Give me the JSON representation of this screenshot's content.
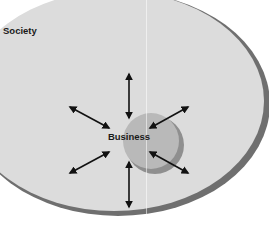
{
  "diagram": {
    "outer_label": "Society",
    "inner_label": "Business",
    "arrows": [
      {
        "direction": "up",
        "type": "bidirectional"
      },
      {
        "direction": "down",
        "type": "bidirectional"
      },
      {
        "direction": "upper-left",
        "type": "bidirectional"
      },
      {
        "direction": "upper-right",
        "type": "bidirectional"
      },
      {
        "direction": "lower-left",
        "type": "bidirectional"
      },
      {
        "direction": "lower-right",
        "type": "bidirectional"
      }
    ],
    "colors": {
      "outer_fill": "#dcdcdc",
      "outer_edge": "#7a7a7a",
      "inner_fill": "#b9b9b9",
      "inner_shadow": "#8f8f8f",
      "arrow": "#111111",
      "text": "#1a1a1a"
    }
  }
}
